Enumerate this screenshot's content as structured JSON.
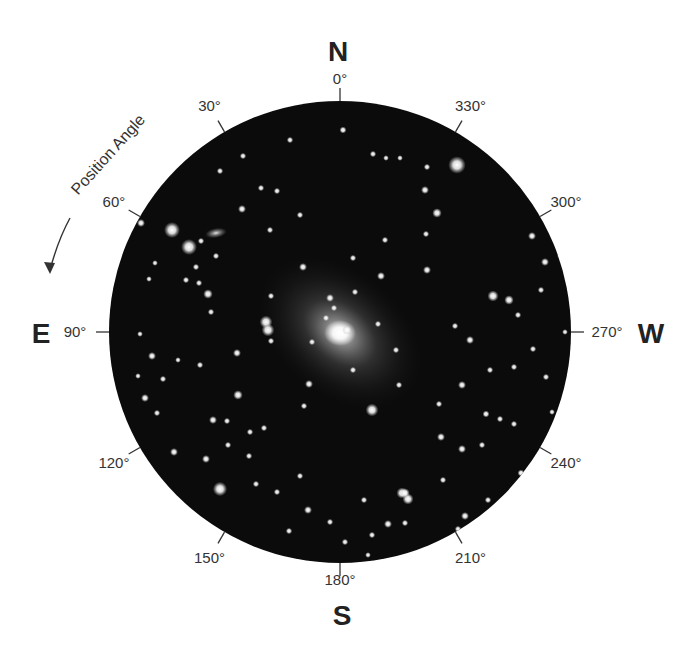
{
  "diagram": {
    "type": "position-angle-finder-chart",
    "field": {
      "center": [
        340,
        332
      ],
      "radius": 231,
      "background_color": "#0b0b0b",
      "edge_color": "#000000"
    },
    "cardinals": [
      {
        "id": "north",
        "label": "N",
        "x": 338,
        "y": 61
      },
      {
        "id": "east",
        "label": "E",
        "x": 41,
        "y": 343
      },
      {
        "id": "west",
        "label": "W",
        "x": 651,
        "y": 343
      },
      {
        "id": "south",
        "label": "S",
        "x": 342,
        "y": 625
      }
    ],
    "angle_ticks": [
      {
        "angle": 0,
        "label": "0°"
      },
      {
        "angle": 30,
        "label": "30°"
      },
      {
        "angle": 60,
        "label": "60°"
      },
      {
        "angle": 90,
        "label": "90°"
      },
      {
        "angle": 120,
        "label": "120°"
      },
      {
        "angle": 150,
        "label": "150°"
      },
      {
        "angle": 180,
        "label": "180°"
      },
      {
        "angle": 210,
        "label": "210°"
      },
      {
        "angle": 240,
        "label": "240°"
      },
      {
        "angle": 270,
        "label": "270°"
      },
      {
        "angle": 300,
        "label": "300°"
      },
      {
        "angle": 330,
        "label": "330°"
      }
    ],
    "position_angle": {
      "label": "Position Angle",
      "direction": "counter-clockwise (N through E)",
      "text_anchor": [
        112,
        158
      ],
      "rotation": -48
    },
    "galaxy": {
      "center": [
        340,
        333
      ],
      "halo_rx": 92,
      "halo_ry": 62,
      "halo_rotation": 40
    },
    "small_galaxy": {
      "center": [
        216,
        233
      ],
      "rx": 11,
      "ry": 5,
      "rotation": -10
    },
    "stars": [
      [
        457,
        165,
        5.5
      ],
      [
        172,
        230,
        5
      ],
      [
        189,
        247,
        5
      ],
      [
        266,
        322,
        4
      ],
      [
        268,
        330,
        4
      ],
      [
        372,
        410,
        4
      ],
      [
        220,
        489,
        4.5
      ],
      [
        402,
        493,
        3.5
      ],
      [
        408,
        499,
        3.5
      ],
      [
        343,
        130,
        2.2
      ],
      [
        290,
        140,
        2
      ],
      [
        373,
        154,
        2
      ],
      [
        386,
        158,
        1.8
      ],
      [
        400,
        158,
        1.8
      ],
      [
        427,
        167,
        2
      ],
      [
        425,
        190,
        2.5
      ],
      [
        437,
        213,
        3
      ],
      [
        426,
        234,
        2
      ],
      [
        385,
        240,
        2
      ],
      [
        353,
        258,
        2
      ],
      [
        427,
        270,
        2.5
      ],
      [
        493,
        296,
        3.5
      ],
      [
        509,
        300,
        3
      ],
      [
        532,
        236,
        2.5
      ],
      [
        545,
        262,
        2.5
      ],
      [
        541,
        290,
        2
      ],
      [
        518,
        315,
        2
      ],
      [
        560,
        256,
        1.8
      ],
      [
        470,
        340,
        2.5
      ],
      [
        490,
        370,
        2
      ],
      [
        514,
        367,
        2
      ],
      [
        462,
        385,
        2.5
      ],
      [
        486,
        414,
        2.2
      ],
      [
        500,
        419,
        2
      ],
      [
        441,
        437,
        2.5
      ],
      [
        462,
        449,
        2.5
      ],
      [
        443,
        480,
        2
      ],
      [
        465,
        516,
        2.5
      ],
      [
        458,
        529,
        2
      ],
      [
        388,
        524,
        2.5
      ],
      [
        405,
        493,
        3
      ],
      [
        347,
        330,
        3
      ],
      [
        330,
        298,
        2.5
      ],
      [
        334,
        308,
        2
      ],
      [
        326,
        318,
        2
      ],
      [
        381,
        276,
        2.5
      ],
      [
        303,
        267,
        2.5
      ],
      [
        271,
        296,
        2
      ],
      [
        353,
        370,
        2
      ],
      [
        309,
        384,
        2.5
      ],
      [
        304,
        406,
        2
      ],
      [
        237,
        353,
        2.5
      ],
      [
        208,
        294,
        3
      ],
      [
        199,
        283,
        2
      ],
      [
        211,
        312,
        2
      ],
      [
        196,
        267,
        2
      ],
      [
        186,
        280,
        2
      ],
      [
        216,
        256,
        2
      ],
      [
        201,
        241,
        2
      ],
      [
        141,
        223,
        2.5
      ],
      [
        220,
        171,
        2
      ],
      [
        243,
        156,
        2
      ],
      [
        242,
        209,
        2.5
      ],
      [
        261,
        188,
        2
      ],
      [
        277,
        191,
        2
      ],
      [
        300,
        215,
        2
      ],
      [
        270,
        230,
        2
      ],
      [
        155,
        263,
        1.8
      ],
      [
        149,
        279,
        1.8
      ],
      [
        140,
        334,
        1.8
      ],
      [
        152,
        356,
        2.5
      ],
      [
        138,
        376,
        1.8
      ],
      [
        163,
        379,
        2
      ],
      [
        145,
        398,
        2.5
      ],
      [
        157,
        413,
        2
      ],
      [
        178,
        360,
        1.8
      ],
      [
        200,
        365,
        2
      ],
      [
        238,
        395,
        3
      ],
      [
        213,
        420,
        2.5
      ],
      [
        227,
        421,
        2
      ],
      [
        250,
        432,
        2
      ],
      [
        228,
        445,
        2
      ],
      [
        264,
        428,
        2
      ],
      [
        206,
        459,
        2.5
      ],
      [
        174,
        452,
        2.5
      ],
      [
        249,
        456,
        2
      ],
      [
        256,
        484,
        2
      ],
      [
        160,
        490,
        2
      ],
      [
        277,
        492,
        2
      ],
      [
        300,
        476,
        2
      ],
      [
        308,
        510,
        2.5
      ],
      [
        289,
        531,
        2
      ],
      [
        330,
        522,
        2
      ],
      [
        372,
        535,
        2
      ],
      [
        345,
        542,
        2
      ],
      [
        368,
        555,
        1.8
      ],
      [
        405,
        523,
        2
      ],
      [
        364,
        500,
        2
      ],
      [
        271,
        341,
        2
      ],
      [
        312,
        342,
        2
      ],
      [
        355,
        292,
        2
      ],
      [
        378,
        324,
        2
      ],
      [
        396,
        350,
        2
      ],
      [
        455,
        326,
        2
      ],
      [
        533,
        349,
        2
      ],
      [
        546,
        377,
        2
      ],
      [
        565,
        332,
        1.8
      ],
      [
        399,
        385,
        2
      ],
      [
        439,
        404,
        2
      ],
      [
        482,
        445,
        2
      ],
      [
        521,
        473,
        2.2
      ],
      [
        488,
        500,
        2
      ],
      [
        514,
        424,
        2
      ],
      [
        552,
        412,
        1.8
      ]
    ]
  }
}
